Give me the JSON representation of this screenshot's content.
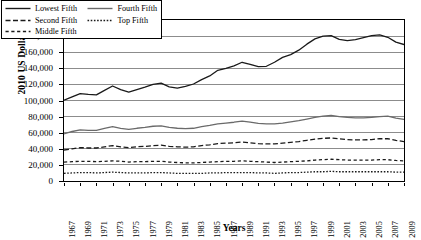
{
  "chart_data": {
    "type": "line",
    "title": "",
    "xlabel": "Years",
    "ylabel": "2010 US Dollars",
    "ylim": [
      0,
      200000
    ],
    "xlim": [
      1967,
      2009
    ],
    "grid": true,
    "legend_position": "top-left-inside",
    "y_ticks": [
      "0",
      "20,000",
      "40,000",
      "60,000",
      "80,000",
      "100,000",
      "120,000",
      "140,000",
      "160,000",
      "180,000",
      "200,000"
    ],
    "y_tick_values": [
      0,
      20000,
      40000,
      60000,
      80000,
      100000,
      120000,
      140000,
      160000,
      180000,
      200000
    ],
    "x": [
      1967,
      1968,
      1969,
      1970,
      1971,
      1972,
      1973,
      1974,
      1975,
      1976,
      1977,
      1978,
      1979,
      1980,
      1981,
      1982,
      1983,
      1984,
      1985,
      1986,
      1987,
      1988,
      1989,
      1990,
      1991,
      1992,
      1993,
      1994,
      1995,
      1996,
      1997,
      1998,
      1999,
      2000,
      2001,
      2002,
      2003,
      2004,
      2005,
      2006,
      2007,
      2008,
      2009
    ],
    "x_tick_labels": [
      "1967",
      "1969",
      "1971",
      "1973",
      "1975",
      "1977",
      "1979",
      "1981",
      "1983",
      "1985",
      "1987",
      "1989",
      "1991",
      "1993",
      "1995",
      "1997",
      "1999",
      "2001",
      "2003",
      "2005",
      "2007",
      "2009"
    ],
    "series": [
      {
        "name": "Lowest Fifth",
        "style": "solid",
        "color": "#1a1a1a",
        "width": 1.3,
        "values": [
          100500,
          104500,
          108500,
          107500,
          107000,
          112500,
          118000,
          113500,
          110500,
          113500,
          116500,
          120000,
          121500,
          117000,
          115500,
          117500,
          120500,
          126000,
          130500,
          137500,
          140000,
          143000,
          147500,
          145000,
          142000,
          142500,
          147500,
          153500,
          157000,
          162500,
          170000,
          176500,
          180000,
          180500,
          176000,
          174500,
          175500,
          178000,
          180500,
          181500,
          178500,
          172500,
          169500
        ]
      },
      {
        "name": "Second Fifth",
        "style": "dashed",
        "color": "#1a1a1a",
        "width": 1.3,
        "values": [
          38500,
          40000,
          41500,
          41000,
          41000,
          42500,
          44000,
          42500,
          41500,
          42500,
          43000,
          44000,
          44500,
          43000,
          42500,
          42000,
          42500,
          44000,
          45000,
          46500,
          47000,
          47500,
          48500,
          47500,
          46500,
          46000,
          46000,
          47000,
          48000,
          49000,
          50500,
          52000,
          53000,
          53500,
          52500,
          51500,
          51000,
          51000,
          51500,
          52500,
          52500,
          50500,
          49000
        ]
      },
      {
        "name": "Middle Fifth",
        "style": "dashdot",
        "color": "#1a1a1a",
        "width": 1.3,
        "values": [
          23500,
          24000,
          24500,
          24500,
          24000,
          24500,
          25000,
          24500,
          23500,
          24000,
          24000,
          24500,
          24500,
          23500,
          23000,
          22500,
          22500,
          23000,
          23500,
          24000,
          24500,
          24500,
          25000,
          24500,
          24000,
          23500,
          23000,
          23500,
          24000,
          24500,
          25000,
          26000,
          26500,
          27000,
          26500,
          26000,
          26000,
          26000,
          26000,
          26500,
          26500,
          25500,
          25000
        ]
      },
      {
        "name": "Fourth Fifth",
        "style": "solid",
        "color": "#6a6a6a",
        "width": 1.3,
        "values": [
          58500,
          61500,
          63500,
          63000,
          63000,
          65500,
          67500,
          65500,
          64000,
          65500,
          66500,
          68000,
          68500,
          66500,
          65500,
          65000,
          65500,
          67500,
          69000,
          71000,
          72000,
          73000,
          74500,
          73000,
          71500,
          71000,
          71000,
          72000,
          73500,
          75000,
          77000,
          79000,
          80500,
          81500,
          80000,
          79000,
          78500,
          78500,
          79000,
          80000,
          80500,
          78000,
          76500
        ]
      },
      {
        "name": "Top Fifth",
        "style": "dotted",
        "color": "#1a1a1a",
        "width": 1.3,
        "values": [
          9500,
          10000,
          10500,
          10500,
          10000,
          10500,
          11000,
          10500,
          10000,
          10000,
          10000,
          10500,
          10500,
          10000,
          9500,
          9500,
          9500,
          9500,
          10000,
          10000,
          10500,
          10500,
          10500,
          10500,
          10000,
          10000,
          9500,
          10000,
          10500,
          10500,
          11000,
          11500,
          11500,
          12000,
          11500,
          11500,
          11500,
          11500,
          11500,
          11500,
          11500,
          11000,
          11000
        ]
      }
    ],
    "legend_entries": [
      {
        "label": "Lowest Fifth",
        "style": "solid",
        "color": "#1a1a1a"
      },
      {
        "label": "Fourth Fifth",
        "style": "solid",
        "color": "#6a6a6a"
      },
      {
        "label": "Second Fifth",
        "style": "dashed",
        "color": "#1a1a1a"
      },
      {
        "label": "Top Fifth",
        "style": "dotted",
        "color": "#1a1a1a"
      },
      {
        "label": "Middle Fifth",
        "style": "dashdot",
        "color": "#1a1a1a"
      }
    ]
  },
  "axes": {
    "y_title": "2010 US Dollars",
    "x_title": "Years"
  },
  "colors": {
    "gridline": "#8c8c8c",
    "frame": "#000000",
    "background": "#ffffff"
  }
}
